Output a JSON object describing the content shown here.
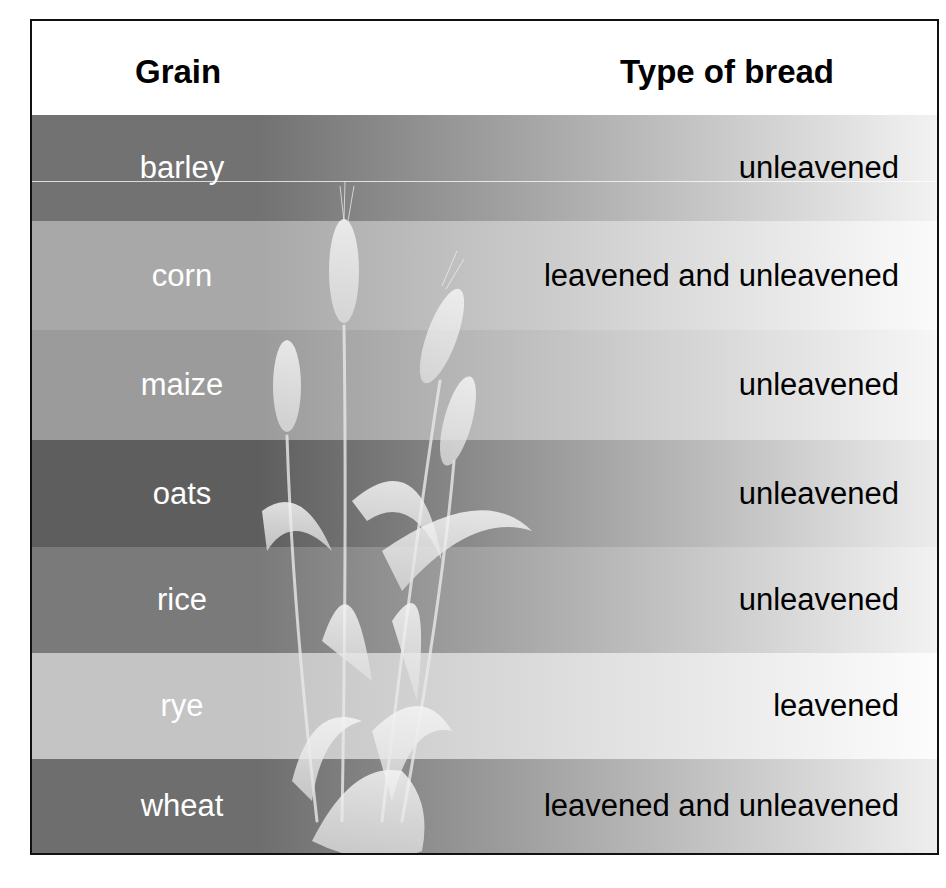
{
  "table": {
    "headers": {
      "grain": "Grain",
      "type": "Type of bread"
    },
    "rows": [
      {
        "grain": "barley",
        "type": "unleavened",
        "band_start": "#727272",
        "band_end": "#f2f2f2",
        "height": 106
      },
      {
        "grain": "corn",
        "type": "leavened and unleavened",
        "band_start": "#a8a8a8",
        "band_end": "#fbfbfb",
        "height": 109
      },
      {
        "grain": "maize",
        "type": "unleavened",
        "band_start": "#9b9b9b",
        "band_end": "#f6f6f6",
        "height": 110
      },
      {
        "grain": "oats",
        "type": "unleavened",
        "band_start": "#5e5e5e",
        "band_end": "#ececec",
        "height": 107
      },
      {
        "grain": "rice",
        "type": "unleavened",
        "band_start": "#7a7a7a",
        "band_end": "#f2f2f2",
        "height": 106
      },
      {
        "grain": "rye",
        "type": "leavened",
        "band_start": "#c4c4c4",
        "band_end": "#fcfcfc",
        "height": 106
      },
      {
        "grain": "wheat",
        "type": "leavened and unleavened",
        "band_start": "#6e6e6e",
        "band_end": "#eeeeee",
        "height": 94
      }
    ]
  },
  "illustration": {
    "icon": "wheat-plant-icon"
  },
  "colors": {
    "border": "#111111",
    "grain_text": "#ffffff",
    "type_text": "#000000"
  }
}
